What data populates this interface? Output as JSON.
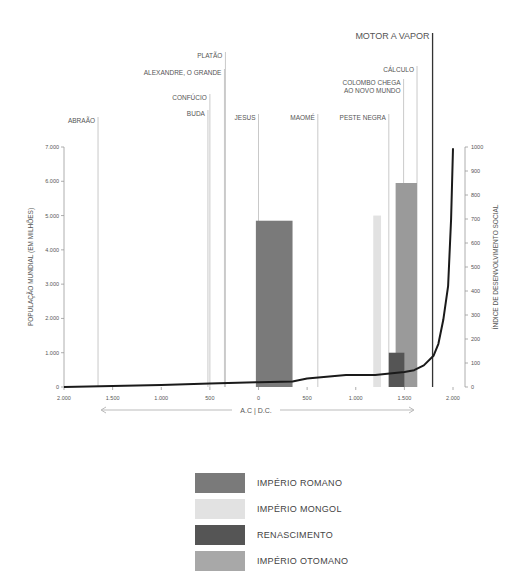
{
  "chart_data": {
    "type": "bar",
    "title": "",
    "xlabel": "A.C | D.C.",
    "ylabel_left": "POPULAÇÃO MUNDIAL (EM MILHÕES)",
    "ylabel_right": "ÍNDICE DE DESENVOLVIMENTO SOCIAL",
    "x_range": [
      -2000,
      2000
    ],
    "x_ticks": [
      {
        "value": -2000,
        "label": "2.000"
      },
      {
        "value": -1500,
        "label": "1.500"
      },
      {
        "value": -1000,
        "label": "1.000"
      },
      {
        "value": -500,
        "label": "500"
      },
      {
        "value": 0,
        "label": "0"
      },
      {
        "value": 500,
        "label": "500"
      },
      {
        "value": 1000,
        "label": "1.000"
      },
      {
        "value": 1500,
        "label": "1.500"
      },
      {
        "value": 2000,
        "label": "2.000"
      }
    ],
    "y_left_range": [
      0,
      7000
    ],
    "y_left_ticks": [
      {
        "value": 0,
        "label": "0"
      },
      {
        "value": 1000,
        "label": "1.000"
      },
      {
        "value": 2000,
        "label": "2.000"
      },
      {
        "value": 3000,
        "label": "3.000"
      },
      {
        "value": 4000,
        "label": "4.000"
      },
      {
        "value": 5000,
        "label": "5.000"
      },
      {
        "value": 6000,
        "label": "6.000"
      },
      {
        "value": 7000,
        "label": "7.000"
      }
    ],
    "y_right_range": [
      0,
      1000
    ],
    "y_right_ticks": [
      0,
      100,
      200,
      300,
      400,
      500,
      600,
      700,
      800,
      900,
      1000
    ],
    "bars": [
      {
        "name": "IMPÉRIO ROMANO",
        "start": -27,
        "end": 350,
        "value": 4850,
        "color": "#7a7a7a"
      },
      {
        "name": "IMPÉRIO MONGOL",
        "start": 1180,
        "end": 1260,
        "value": 5000,
        "color": "#e2e2e2"
      },
      {
        "name": "IMPÉRIO OTOMANO",
        "start": 1410,
        "end": 1630,
        "value": 5950,
        "color": "#9a9a9a"
      },
      {
        "name": "RENASCIMENTO",
        "start": 1340,
        "end": 1500,
        "value": 1000,
        "color": "#555555"
      }
    ],
    "series": [
      {
        "name": "Índice de desenvolvimento social",
        "axis": "right",
        "x": [
          -2000,
          -1500,
          -1000,
          -500,
          0,
          350,
          500,
          900,
          1200,
          1400,
          1500,
          1600,
          1700,
          1800,
          1850,
          1900,
          1950,
          1980,
          2000
        ],
        "values": [
          0,
          4,
          8,
          14,
          20,
          23,
          35,
          50,
          50,
          58,
          62,
          70,
          90,
          130,
          180,
          280,
          420,
          700,
          995
        ]
      }
    ],
    "events": [
      {
        "label": "ABRAÃO",
        "year": -1650
      },
      {
        "label": "BUDA",
        "year": -520
      },
      {
        "label": "CONFÚCIO",
        "year": -500
      },
      {
        "label": "ALEXANDRE, O GRANDE",
        "year": -350
      },
      {
        "label": "PLATÃO",
        "year": -340
      },
      {
        "label": "JESUS",
        "year": 0
      },
      {
        "label": "MAOMÉ",
        "year": 610
      },
      {
        "label": "PESTE NEGRA",
        "year": 1340
      },
      {
        "label": "COLOMBO CHEGA",
        "label2": "AO NOVO MUNDO",
        "year": 1492
      },
      {
        "label": "CÁLCULO",
        "year": 1630
      },
      {
        "label": "MOTOR A VAPOR",
        "year": 1790
      }
    ],
    "legend_position": "bottom-center",
    "grid": false
  },
  "legend": [
    {
      "label": "IMPÉRIO ROMANO",
      "color": "#7a7a7a"
    },
    {
      "label": "IMPÉRIO MONGOL",
      "color": "#e2e2e2"
    },
    {
      "label": "RENASCIMENTO",
      "color": "#555555"
    },
    {
      "label": "IMPÉRIO OTOMANO",
      "color": "#a8a8a8"
    }
  ]
}
